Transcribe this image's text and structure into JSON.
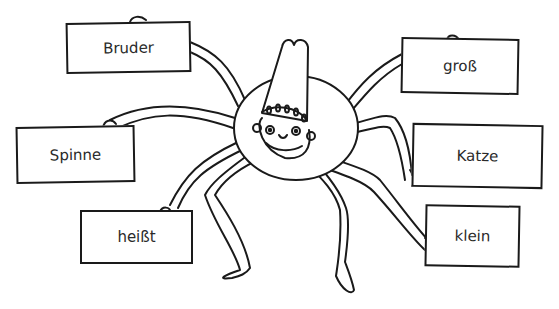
{
  "illustration": {
    "subject": "spider with tall hat holding word cards",
    "line_color": "#1a1a1a",
    "background": "#ffffff"
  },
  "word_cards": [
    {
      "id": "bruder",
      "label": "Bruder",
      "x": 66,
      "y": 22,
      "w": 125,
      "h": 51,
      "rot": -1
    },
    {
      "id": "gross",
      "label": "groß",
      "x": 401,
      "y": 38,
      "w": 118,
      "h": 56,
      "rot": 1
    },
    {
      "id": "spinne",
      "label": "Spinne",
      "x": 16,
      "y": 126,
      "w": 119,
      "h": 57,
      "rot": -1
    },
    {
      "id": "katze",
      "label": "Katze",
      "x": 412,
      "y": 124,
      "w": 131,
      "h": 64,
      "rot": 1
    },
    {
      "id": "heisst",
      "label": "heißt",
      "x": 80,
      "y": 210,
      "w": 113,
      "h": 54,
      "rot": 0
    },
    {
      "id": "klein",
      "label": "klein",
      "x": 425,
      "y": 205,
      "w": 95,
      "h": 62,
      "rot": 1
    }
  ]
}
